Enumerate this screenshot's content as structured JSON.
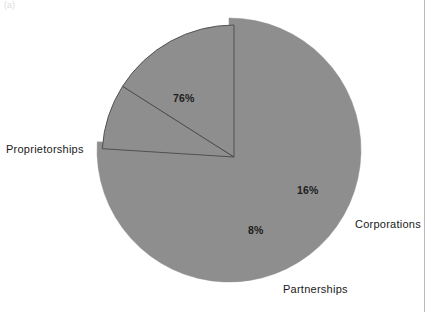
{
  "figure": {
    "tag": "(a)",
    "background_color": "#ffffff",
    "rule_color": "#b9b9b9"
  },
  "chart_data": {
    "type": "pie",
    "title": "",
    "subtitle": "",
    "xlabel": "",
    "ylabel": "",
    "grid": false,
    "legend_position": "outside-labels",
    "slice_color": "#8e8e8e",
    "slice_edge_color": "#ffffff",
    "divider_color": "#4a4a4a",
    "exploded_group": [
      "Partnerships",
      "Corporations"
    ],
    "categories": [
      "Proprietorships",
      "Partnerships",
      "Corporations"
    ],
    "values": [
      76,
      8,
      16
    ],
    "value_labels": [
      "76%",
      "8%",
      "16%"
    ],
    "units": "percent",
    "slices": [
      {
        "label": "Proprietorships",
        "value": 76,
        "value_label": "76%",
        "exploded": false,
        "start_angle_deg": 0,
        "end_angle_deg": 273.6
      },
      {
        "label": "Partnerships",
        "value": 8,
        "value_label": "8%",
        "exploded": true,
        "start_angle_deg": 273.6,
        "end_angle_deg": 302.4
      },
      {
        "label": "Corporations",
        "value": 16,
        "value_label": "16%",
        "exploded": true,
        "start_angle_deg": 302.4,
        "end_angle_deg": 360
      }
    ]
  },
  "labels": {
    "proprietorships": "Proprietorships",
    "partnerships": "Partnerships",
    "corporations": "Corporations",
    "pct_proprietorships": "76%",
    "pct_partnerships": "8%",
    "pct_corporations": "16%"
  }
}
